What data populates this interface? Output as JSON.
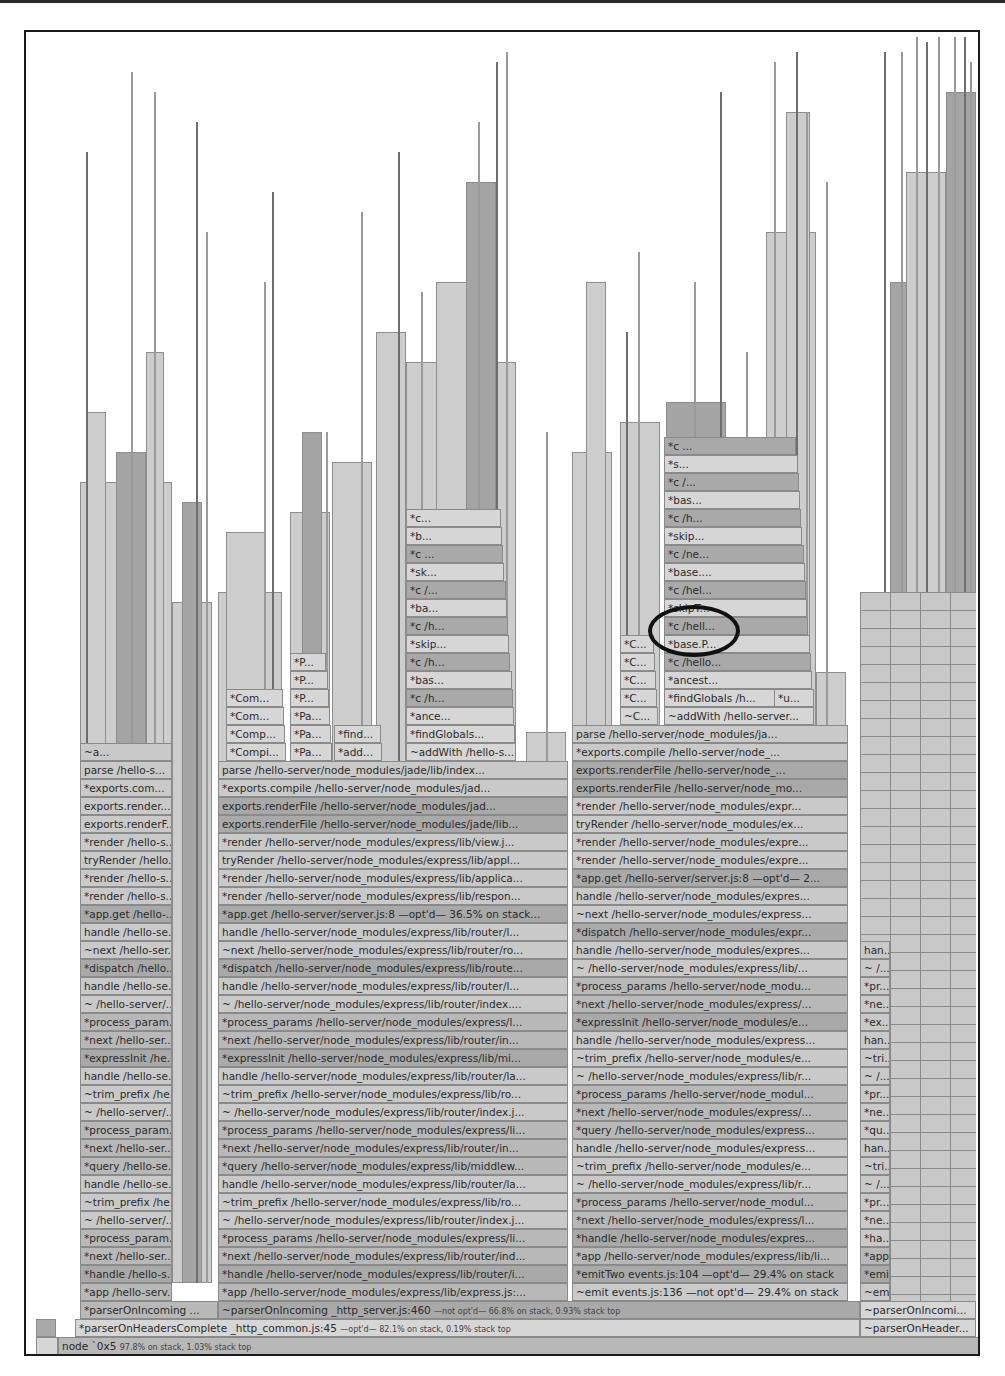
{
  "view": "flame-graph",
  "root": {
    "label": "node `0x5",
    "meta": "97.8% on stack, 1.03% stack top"
  },
  "row1": {
    "main": {
      "label": "*parserOnHeadersComplete _http_common.js:45",
      "meta": "—opt'd— 82.1% on stack, 0.19% stack top"
    },
    "right": {
      "label": "~parserOnHeader..."
    }
  },
  "row2": {
    "left": {
      "label": "*parserOnIncoming ..."
    },
    "main": {
      "label": "~parserOnIncoming _http_server.js:460",
      "meta": "—not opt'd— 66.8% on stack, 0.93% stack top"
    },
    "right": {
      "label": "~parserOnIncomi..."
    }
  },
  "col_a": {
    "rows": [
      "*app /hello-serv...",
      "*handle /hello-s...",
      "*next /hello-ser...",
      "*process_param...",
      "~ /hello-server/...",
      "~trim_prefix /he...",
      "handle /hello-se...",
      "*query /hello-se...",
      "*next /hello-ser...",
      "*process_param...",
      "~ /hello-server/...",
      "~trim_prefix /he...",
      "handle /hello-se...",
      "*expressInit /he...",
      "*next /hello-ser...",
      "*process_param...",
      "~ /hello-server/...",
      "handle /hello-se...",
      "*dispatch /hello...",
      "~next /hello-ser...",
      "handle /hello-se...",
      "*app.get /hello-...",
      "*render /hello-s...",
      "*render /hello-s...",
      "tryRender /hello...",
      "*render /hello-s...",
      "exports.renderF...",
      "exports.render...",
      "*exports.com...",
      "parse /hello-s...",
      "~a..."
    ]
  },
  "col_b": {
    "rows": [
      "*app /hello-server/node_modules/express/lib/express.js:...",
      "*handle /hello-server/node_modules/express/lib/router/i...",
      "*next /hello-server/node_modules/express/lib/router/ind...",
      "*process_params /hello-server/node_modules/express/li...",
      "~ /hello-server/node_modules/express/lib/router/index.j...",
      "~trim_prefix /hello-server/node_modules/express/lib/ro...",
      "handle /hello-server/node_modules/express/lib/router/la...",
      "*query /hello-server/node_modules/express/lib/middlew...",
      "*next /hello-server/node_modules/express/lib/router/in...",
      "*process_params /hello-server/node_modules/express/li...",
      "~ /hello-server/node_modules/express/lib/router/index.j...",
      "~trim_prefix /hello-server/node_modules/express/lib/ro...",
      "handle /hello-server/node_modules/express/lib/router/la...",
      "*expressInit /hello-server/node_modules/express/lib/mi...",
      "*next /hello-server/node_modules/express/lib/router/in...",
      "*process_params /hello-server/node_modules/express/l...",
      "~ /hello-server/node_modules/express/lib/router/index....",
      "handle /hello-server/node_modules/express/lib/router/l...",
      "*dispatch /hello-server/node_modules/express/lib/route...",
      "~next /hello-server/node_modules/express/lib/router/ro...",
      "handle /hello-server/node_modules/express/lib/router/l...",
      "*app.get /hello-server/server.js:8 —opt'd— 36.5% on stack...",
      "*render /hello-server/node_modules/express/lib/respon...",
      "*render /hello-server/node_modules/express/lib/applica...",
      "tryRender /hello-server/node_modules/express/lib/appl...",
      "*render /hello-server/node_modules/express/lib/view.j...",
      "exports.renderFile /hello-server/node_modules/jade/lib...",
      "exports.renderFile /hello-server/node_modules/jad...",
      "*exports.compile /hello-server/node_modules/jad...",
      "parse /hello-server/node_modules/jade/lib/index..."
    ],
    "upper": {
      "compiler_col": [
        "*Compi...",
        "*Comp...",
        "*Com...",
        "*Com..."
      ],
      "pa_col": [
        "*Pa...",
        "*Pa...",
        "*Pa...",
        "*P...",
        "*P...",
        "*P..."
      ],
      "find_col": [
        "*add...",
        "*find..."
      ],
      "globals_col": [
        "~addWith /hello-s...",
        "*findGlobals...",
        "*ance...",
        "*c /h...",
        "*bas...",
        "*c /h...",
        "*skip...",
        "*c /h...",
        "*ba...",
        "*c /...",
        "*sk...",
        "*c ...",
        "*b...",
        "*c..."
      ]
    }
  },
  "col_c": {
    "rows": [
      "~emit events.js:136 —not opt'd— 29.4% on stack",
      "*emitTwo events.js:104 —opt'd— 29.4% on stack",
      "*app /hello-server/node_modules/express/lib/li...",
      "*handle /hello-server/node_modules/expres...",
      "*next /hello-server/node_modules/express/l...",
      "*process_params /hello-server/node_modul...",
      "~ /hello-server/node_modules/express/lib/r...",
      "~trim_prefix /hello-server/node_modules/e...",
      "handle /hello-server/node_modules/express...",
      "*query /hello-server/node_modules/express...",
      "*next /hello-server/node_modules/express/...",
      "*process_params /hello-server/node_modul...",
      "~ /hello-server/node_modules/express/lib/r...",
      "~trim_prefix /hello-server/node_modules/e...",
      "handle /hello-server/node_modules/express...",
      "*expressInit /hello-server/node_modules/e...",
      "*next /hello-server/node_modules/express/...",
      "*process_params /hello-server/node_modu...",
      "~ /hello-server/node_modules/express/lib/...",
      "handle /hello-server/node_modules/expres...",
      "*dispatch /hello-server/node_modules/expr...",
      "~next /hello-server/node_modules/express...",
      "handle /hello-server/node_modules/expres...",
      "*app.get /hello-server/server.js:8 —opt'd— 2...",
      "*render /hello-server/node_modules/expre...",
      "*render /hello-server/node_modules/expre...",
      "tryRender /hello-server/node_modules/ex...",
      "*render /hello-server/node_modules/expr...",
      "exports.renderFile /hello-server/node_mo...",
      "exports.renderFile /hello-server/node_...",
      "*exports.compile /hello-server/node_...",
      "parse /hello-server/node_modules/ja..."
    ],
    "upper": {
      "c_col": [
        "~C...",
        "*C...",
        "*C...",
        "*C...",
        "*C..."
      ],
      "addwith_col": [
        "~addWith /hello-server...",
        "*findGlobals /h...",
        "*ancest...",
        "*c /hello...",
        "*base.P...",
        "*c /hell...",
        "*skipT...",
        "*c /hel...",
        "*base....",
        "*c /ne...",
        "*skip...",
        "*c /h...",
        "*bas...",
        "*c /...",
        "*s...",
        "*c ..."
      ],
      "u_label": "*u..."
    }
  },
  "col_d": {
    "rows": [
      "~emit events.js:1...",
      "*emitTwo ...",
      "*app /h...",
      "*ha...",
      "*ne...",
      "*pr...",
      "~ /...",
      "~tri...",
      "han...",
      "*qu...",
      "*ne...",
      "*pr...",
      "~ /...",
      "~tri...",
      "han...",
      "*ex...",
      "*ne...",
      "*pr...",
      "~ /...",
      "han..."
    ],
    "side": [
      "~e...",
      "~a...",
      "~h...",
      "~h...",
      "~n..."
    ]
  },
  "annotation": {
    "type": "circle",
    "target": "*c /hell..."
  }
}
